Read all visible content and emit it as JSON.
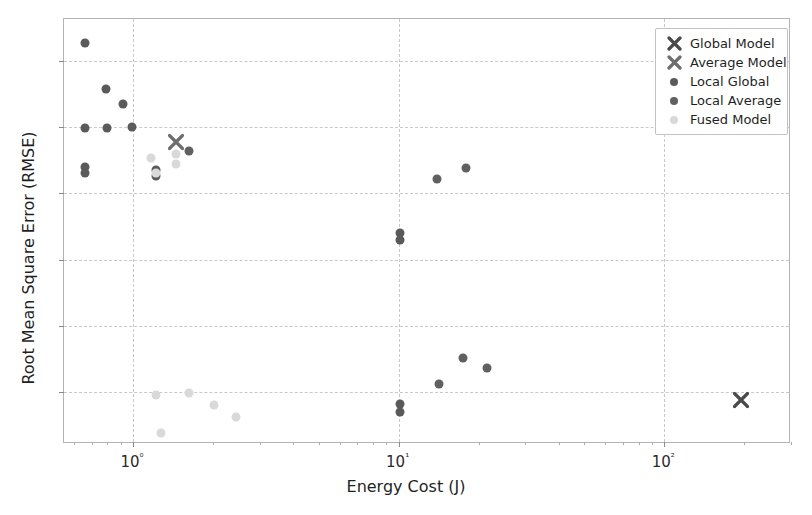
{
  "chart_data": {
    "type": "scatter",
    "title": "",
    "xlabel": "Energy Cost (J)",
    "ylabel": "Root Mean Square Error (RMSE)",
    "xscale": "log",
    "yscale": "linear",
    "xlim": [
      0.55,
      300
    ],
    "ylim": [
      10.22,
      16.63
    ],
    "xticks": [
      "10⁰",
      "10¹",
      "10²"
    ],
    "xtick_values": [
      1,
      10,
      100
    ],
    "yticks": [
      "11",
      "12",
      "13",
      "14",
      "15",
      "16"
    ],
    "ytick_values": [
      11,
      12,
      13,
      14,
      15,
      16
    ],
    "grid": true,
    "legend_position": "upper right",
    "series": [
      {
        "name": "Global Model",
        "marker": "x",
        "color": "#4a4a4a",
        "points": [
          {
            "x": 195.0,
            "y": 10.88
          }
        ]
      },
      {
        "name": "Average Model",
        "marker": "x",
        "color": "#6e6e6e",
        "points": [
          {
            "x": 1.45,
            "y": 14.77
          }
        ]
      },
      {
        "name": "Local Global",
        "marker": "o",
        "color": "#5a5a5a",
        "points": [
          {
            "x": 0.66,
            "y": 16.27
          },
          {
            "x": 0.79,
            "y": 15.58
          },
          {
            "x": 0.92,
            "y": 15.35
          },
          {
            "x": 0.66,
            "y": 14.99
          },
          {
            "x": 0.8,
            "y": 14.98
          },
          {
            "x": 0.99,
            "y": 15.0
          },
          {
            "x": 0.66,
            "y": 14.4
          },
          {
            "x": 0.66,
            "y": 14.3
          },
          {
            "x": 1.22,
            "y": 14.36
          },
          {
            "x": 1.22,
            "y": 14.26
          },
          {
            "x": 10.1,
            "y": 13.4
          },
          {
            "x": 10.1,
            "y": 13.3
          },
          {
            "x": 10.1,
            "y": 10.82
          },
          {
            "x": 10.1,
            "y": 10.7
          }
        ]
      },
      {
        "name": "Local Average",
        "marker": "o",
        "color": "#606060",
        "points": [
          {
            "x": 1.62,
            "y": 14.64
          },
          {
            "x": 14.0,
            "y": 14.22
          },
          {
            "x": 18.0,
            "y": 14.38
          },
          {
            "x": 14.2,
            "y": 11.12
          },
          {
            "x": 17.5,
            "y": 11.52
          },
          {
            "x": 21.5,
            "y": 11.36
          }
        ]
      },
      {
        "name": "Fused Model",
        "marker": "o",
        "color": "#d9d9d9",
        "points": [
          {
            "x": 1.17,
            "y": 14.54
          },
          {
            "x": 1.22,
            "y": 14.3
          },
          {
            "x": 1.45,
            "y": 14.6
          },
          {
            "x": 1.22,
            "y": 10.96
          },
          {
            "x": 1.62,
            "y": 10.99
          },
          {
            "x": 1.28,
            "y": 10.38
          },
          {
            "x": 2.02,
            "y": 10.81
          },
          {
            "x": 2.45,
            "y": 10.62
          },
          {
            "x": 1.45,
            "y": 14.44
          }
        ]
      }
    ],
    "legend": [
      {
        "label": "Global Model",
        "marker": "x",
        "color": "#4a4a4a"
      },
      {
        "label": "Average Model",
        "marker": "x",
        "color": "#6e6e6e"
      },
      {
        "label": "Local Global",
        "marker": "o",
        "color": "#5a5a5a"
      },
      {
        "label": "Local Average",
        "marker": "o",
        "color": "#606060"
      },
      {
        "label": "Fused Model",
        "marker": "o",
        "color": "#d9d9d9"
      }
    ]
  }
}
